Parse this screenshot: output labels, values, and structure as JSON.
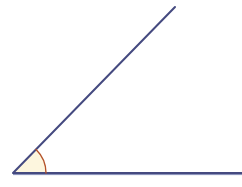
{
  "canvas": {
    "width": 242,
    "height": 187,
    "background_color": "#ffffff",
    "title": "Acute angle diagram"
  },
  "colors": {
    "ray_stroke": "#454a80",
    "ray_stroke_light": "#6b74a8",
    "arc_stroke": "#b4532a",
    "arc_fill": "#fdf6de",
    "background": "#ffffff"
  },
  "figure": {
    "type": "angle",
    "vertex": {
      "x": 13,
      "y": 173,
      "label": ""
    },
    "rays": [
      {
        "name": "horizontal-ray",
        "from": {
          "x": 13,
          "y": 173
        },
        "to": {
          "x": 242,
          "y": 173
        },
        "stroke_width": 2,
        "direction_degrees": 0
      },
      {
        "name": "diagonal-ray",
        "from": {
          "x": 13,
          "y": 173
        },
        "to": {
          "x": 175,
          "y": 7
        },
        "stroke_width": 2,
        "direction_degrees": 45.7
      }
    ],
    "arc": {
      "name": "angle-arc",
      "center": {
        "x": 13,
        "y": 173
      },
      "radius": 33,
      "start_degrees": 0,
      "end_degrees": 45.7,
      "stroke_width": 1.4,
      "filled": true
    },
    "angle_measure_degrees": 46,
    "angle_classification": "acute"
  },
  "labels": {
    "vertex_label": "",
    "angle_label": "",
    "ray_a_label": "",
    "ray_b_label": ""
  }
}
